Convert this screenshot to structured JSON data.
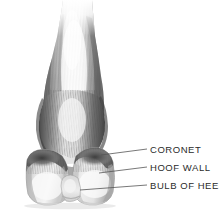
{
  "figure": {
    "background_color": "#ffffff",
    "text_color": "#2b2b2b",
    "leader_line_color": "#555555"
  },
  "labels": [
    {
      "id": "coronet",
      "text": "CORONET",
      "x": 150,
      "y": 144,
      "leader_from": [
        101,
        155
      ],
      "leader_to": [
        147,
        149
      ]
    },
    {
      "id": "hoof_wall",
      "text": "HOOF WALL",
      "x": 150,
      "y": 162,
      "leader_from": [
        99,
        173
      ],
      "leader_to": [
        147,
        167
      ]
    },
    {
      "id": "bulb_of_heel",
      "text": "BULB OF HEEL",
      "x": 150,
      "y": 180,
      "leader_from": [
        80,
        190
      ],
      "leader_to": [
        147,
        185
      ]
    }
  ],
  "illustration": {
    "medium": "graphite pencil drawing",
    "subject": "pair of horse hooves with fetlock and cannon bone, viewed from behind",
    "parts": [
      "cannon bone / lower leg with hair strokes",
      "fetlock joint",
      "pastern",
      "coronet band",
      "hoof wall (left hoof)",
      "hoof wall (right hoof)",
      "bulb of heel"
    ],
    "palette": {
      "darkest": "#3a3a3a",
      "mid_shadow": "#7d7d7d",
      "light_gray": "#c9c9c9",
      "highlight": "#f2f2f2"
    }
  }
}
